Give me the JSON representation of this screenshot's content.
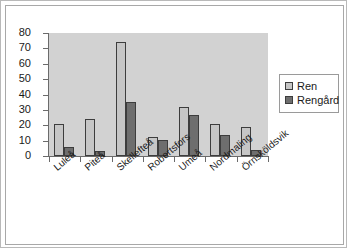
{
  "chart_data": {
    "type": "bar",
    "title": "",
    "xlabel": "",
    "ylabel": "",
    "ylim": [
      0,
      80
    ],
    "ytick_step": 10,
    "yticks": [
      "0",
      "10",
      "20",
      "30",
      "40",
      "50",
      "60",
      "70",
      "80"
    ],
    "grid": false,
    "legend_position": "right",
    "categories": [
      "Luleå",
      "Piteå",
      "Skellefteå",
      "Robertsfors",
      "Umeå",
      "Nordmaling",
      "Örnsköldsvik"
    ],
    "series": [
      {
        "name": "Ren",
        "color": "#c6c6c6",
        "values": [
          21,
          24,
          74,
          12.5,
          32,
          21,
          19
        ]
      },
      {
        "name": "Rengård",
        "color": "#6e6e6e",
        "values": [
          6,
          3,
          35,
          10.5,
          27,
          13.5,
          4
        ]
      }
    ]
  },
  "legend": {
    "items": [
      {
        "label": "Ren"
      },
      {
        "label": "Rengård"
      }
    ]
  },
  "colors": {
    "plot_background": "#d2d2d2",
    "axis": "#6b6b6b",
    "bar_outline": "#3d3d3d",
    "frame_outer": "#b9b9b9",
    "frame_inner": "#a8a8a8"
  }
}
